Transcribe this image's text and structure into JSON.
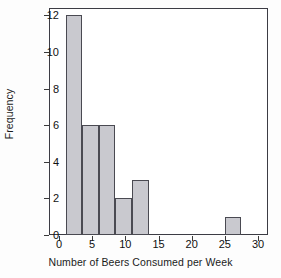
{
  "chart_data": {
    "type": "bar",
    "title": "",
    "subtitle": "",
    "xlabel": "Number of Beers Consumed per Week",
    "ylabel": "Frequency",
    "xlim": [
      -1.5,
      31.5
    ],
    "ylim": [
      0,
      12.4
    ],
    "grid": false,
    "legend": null,
    "bin_width": 2.5,
    "bin_edges": [
      1,
      3.5,
      6,
      8.5,
      11,
      13.5,
      25,
      27.5
    ],
    "bins": [
      {
        "x_start": 1,
        "x_end": 3.5,
        "frequency": 12
      },
      {
        "x_start": 3.5,
        "x_end": 6,
        "frequency": 6
      },
      {
        "x_start": 6,
        "x_end": 8.5,
        "frequency": 6
      },
      {
        "x_start": 8.5,
        "x_end": 11,
        "frequency": 2
      },
      {
        "x_start": 11,
        "x_end": 13.5,
        "frequency": 3
      },
      {
        "x_start": 25,
        "x_end": 27.5,
        "frequency": 1
      }
    ],
    "categories": [
      "1-3.5",
      "3.5-6",
      "6-8.5",
      "8.5-11",
      "11-13.5",
      "25-27.5"
    ],
    "values": [
      12,
      6,
      6,
      2,
      3,
      1
    ],
    "xticks": [
      0,
      5,
      10,
      15,
      20,
      25,
      30
    ],
    "xtick_labels": [
      "0",
      "5",
      "10",
      "15",
      "20",
      "25",
      "30"
    ],
    "yticks": [
      0,
      2,
      4,
      6,
      8,
      10,
      12
    ],
    "ytick_labels": [
      "0",
      "2",
      "4",
      "6",
      "8",
      "10",
      "12"
    ],
    "total_count": 30,
    "bar_fill_color": "#c9c9cf",
    "bar_edge_color": "#4a4a52",
    "frame_color": "#3c3c44",
    "background_color": "#ffffff"
  }
}
